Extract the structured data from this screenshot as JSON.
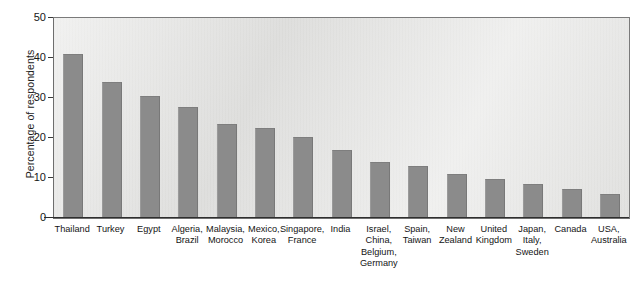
{
  "chart_data": {
    "type": "bar",
    "title": "",
    "xlabel": "",
    "ylabel": "Percentage of respondents",
    "ylim": [
      0,
      50
    ],
    "yticks": [
      0,
      10,
      20,
      30,
      40,
      50
    ],
    "grid": false,
    "legend": null,
    "categories": [
      "Thailand",
      "Turkey",
      "Egypt",
      "Algeria, Brazil",
      "Malaysia, Morocco",
      "Mexico, Korea",
      "Singapore, France",
      "India",
      "Israel, China, Belgium, Germany",
      "Spain, Taiwan",
      "New Zealand",
      "United Kingdom",
      "Japan, Italy, Sweden",
      "Canada",
      "USA, Australia"
    ],
    "category_lines": [
      [
        "Thailand"
      ],
      [
        "Turkey"
      ],
      [
        "Egypt"
      ],
      [
        "Algeria,",
        "Brazil"
      ],
      [
        "Malaysia,",
        "Morocco"
      ],
      [
        "Mexico,",
        "Korea"
      ],
      [
        "Singapore,",
        "France"
      ],
      [
        "India"
      ],
      [
        "Israel,",
        "China,",
        "Belgium,",
        "Germany"
      ],
      [
        "Spain,",
        "Taiwan"
      ],
      [
        "New",
        "Zealand"
      ],
      [
        "United",
        "Kingdom"
      ],
      [
        "Japan,",
        "Italy,",
        "Sweden"
      ],
      [
        "Canada"
      ],
      [
        "USA,",
        "Australia"
      ]
    ],
    "values": [
      41,
      34,
      30.5,
      27.7,
      23.6,
      22.4,
      20.3,
      17,
      14,
      13,
      11,
      9.7,
      8.4,
      7.2,
      6.1
    ],
    "colors": {
      "bar_fill": "#8b8b8b",
      "plot_background": "#e6e6e4",
      "axis": "#2e2e2e",
      "frame": "#6e6e6e",
      "text": "#141414",
      "page_background": "#ffffff"
    }
  }
}
